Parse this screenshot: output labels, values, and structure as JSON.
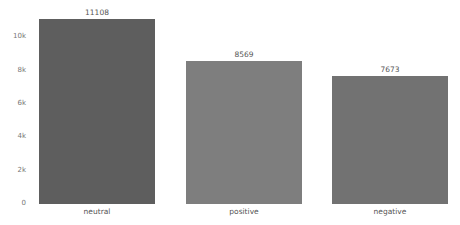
{
  "chart_data": {
    "type": "bar",
    "title": "",
    "xlabel": "",
    "ylabel": "",
    "categories": [
      "neutral",
      "positive",
      "negative"
    ],
    "values": [
      11108,
      8569,
      7673
    ],
    "value_labels": [
      "11108",
      "8569",
      "7673"
    ],
    "ylim": [
      0,
      11108
    ],
    "yticks": [
      0,
      2000,
      4000,
      6000,
      8000,
      10000
    ],
    "ytick_labels": [
      "0",
      "2k",
      "4k",
      "6k",
      "8k",
      "10k"
    ],
    "grid": false,
    "legend": null,
    "colors": [
      "#5e5e5e",
      "#7e7e7e",
      "#727272"
    ]
  },
  "layout": {
    "plot_left": 39,
    "plot_bottom": 204,
    "px_per_unit": 0.016657,
    "bar_width": 116,
    "bar_lefts": [
      39,
      186,
      332
    ]
  }
}
